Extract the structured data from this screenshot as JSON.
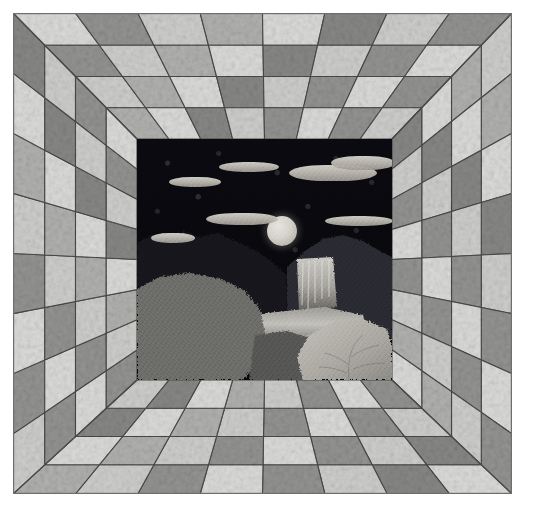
{
  "artwork": {
    "title": "Attic Windows Perspective Quilt with Moonlit Landscape Center",
    "type": "quilt-photograph",
    "canvas": {
      "width": 535,
      "height": 521,
      "background": "#ffffff"
    },
    "quilt_bounds": {
      "left": 13,
      "top": 13,
      "width": 499,
      "height": 481
    }
  },
  "border": {
    "name": "attic-windows-perspective-border",
    "description": "Four concentric square rings of alternating light and dark parallelogram patches radiating from the center panel, creating a one-point perspective tunnel effect.",
    "ring_count": 4,
    "rings": [
      {
        "index": 0,
        "label": "outer-ring",
        "inset": 0,
        "thickness": 32
      },
      {
        "index": 1,
        "label": "second-ring",
        "inset": 32,
        "thickness": 31
      },
      {
        "index": 2,
        "label": "third-ring",
        "inset": 63,
        "thickness": 31
      },
      {
        "index": 3,
        "label": "inner-ring",
        "inset": 94,
        "thickness": 31
      }
    ],
    "divisions_per_side": 8,
    "seam_color": "#4a4a4a",
    "seam_width": 1.1,
    "colors": {
      "light": "#dcdcda",
      "light_alt": "#cfcfcd",
      "mid": "#b2b2b0",
      "dark": "#949492",
      "dark_alt": "#888886",
      "binding": "#b9b9b9"
    },
    "mottle_note": "All patches use a mottled/marbled tone-on-tone grey fabric print."
  },
  "center_panel": {
    "name": "landscape-center-panel",
    "bounds": {
      "left": 124,
      "top": 126,
      "width": 255,
      "height": 241
    },
    "scene": "Night landscape: full moon and clouds over a dark printed sky, mountains, waterfall, pond and foliage.",
    "sky": {
      "name": "night-sky",
      "fabric": "dark navy-black rose/medallion print",
      "color": "#08080d",
      "motif_color": "#787882"
    },
    "moon": {
      "name": "moon",
      "cx": 145,
      "cy": 92,
      "r": 15,
      "color": "#d6d3cc"
    },
    "clouds": [
      {
        "name": "cloud-upper-left",
        "cx": 58,
        "cy": 43,
        "rx": 26,
        "ry": 5
      },
      {
        "name": "cloud-upper-mid",
        "cx": 112,
        "cy": 28,
        "rx": 30,
        "ry": 5
      },
      {
        "name": "cloud-upper-right-a",
        "cx": 196,
        "cy": 34,
        "rx": 44,
        "ry": 8
      },
      {
        "name": "cloud-upper-right-b",
        "cx": 226,
        "cy": 24,
        "rx": 32,
        "ry": 7
      },
      {
        "name": "cloud-mid-left",
        "cx": 105,
        "cy": 80,
        "rx": 36,
        "ry": 6
      },
      {
        "name": "cloud-mid-right",
        "cx": 222,
        "cy": 82,
        "rx": 34,
        "ry": 5
      },
      {
        "name": "cloud-low-left",
        "cx": 36,
        "cy": 99,
        "rx": 22,
        "ry": 5
      }
    ],
    "terrain": [
      {
        "name": "left-dark-treeline",
        "color": "#1d1d22",
        "tone": "very dark swirl print"
      },
      {
        "name": "right-mountain-ridge",
        "color": "#2a2a2e",
        "tone": "dark mottled"
      },
      {
        "name": "waterfall",
        "color": "#cfcdc6",
        "tone": "pale streaked"
      },
      {
        "name": "pond-water",
        "color": "#8e8c86",
        "tone": "light grey streak"
      },
      {
        "name": "left-grey-rockface",
        "color": "#6f6f6c",
        "tone": "medium grey mottle"
      },
      {
        "name": "right-light-bush",
        "color": "#b0aea7",
        "tone": "light leafy print"
      },
      {
        "name": "foreground-rock",
        "color": "#5a5a58",
        "tone": "mid grey"
      }
    ]
  }
}
